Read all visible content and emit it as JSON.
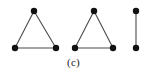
{
  "figure": {
    "caption": "(c)",
    "background_color": "#ffffff",
    "node_color": "#111111",
    "edge_color": "#4a4a4a",
    "node_radius": 3.2,
    "edge_width": 1.1,
    "width": 147,
    "height": 77
  },
  "chart_data": {
    "type": "diagram",
    "title": "(c)",
    "components": [
      {
        "name": "triangle-left",
        "component_type": "triangle",
        "node_count": 3,
        "edge_count": 3,
        "nodes": [
          {
            "id": "a1",
            "x": 34,
            "y": 11
          },
          {
            "id": "a2",
            "x": 15,
            "y": 48
          },
          {
            "id": "a3",
            "x": 56,
            "y": 48
          }
        ],
        "edges": [
          {
            "from": "a1",
            "to": "a2"
          },
          {
            "from": "a1",
            "to": "a3"
          },
          {
            "from": "a2",
            "to": "a3"
          }
        ]
      },
      {
        "name": "triangle-right",
        "component_type": "triangle",
        "node_count": 3,
        "edge_count": 3,
        "nodes": [
          {
            "id": "b1",
            "x": 94,
            "y": 11
          },
          {
            "id": "b2",
            "x": 75,
            "y": 48
          },
          {
            "id": "b3",
            "x": 113,
            "y": 48
          }
        ],
        "edges": [
          {
            "from": "b1",
            "to": "b2"
          },
          {
            "from": "b1",
            "to": "b3"
          },
          {
            "from": "b2",
            "to": "b3"
          }
        ]
      },
      {
        "name": "edge-segment",
        "component_type": "edge",
        "node_count": 2,
        "edge_count": 1,
        "nodes": [
          {
            "id": "c1",
            "x": 136,
            "y": 11
          },
          {
            "id": "c2",
            "x": 136,
            "y": 48
          }
        ],
        "edges": [
          {
            "from": "c1",
            "to": "c2"
          }
        ]
      }
    ]
  }
}
